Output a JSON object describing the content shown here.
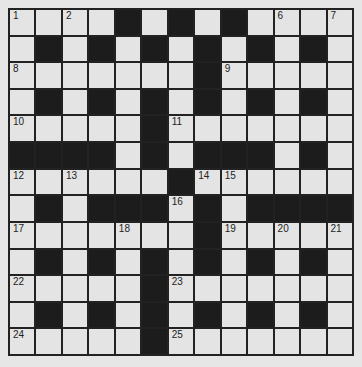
{
  "puzzle": {
    "rows": 13,
    "cols": 13,
    "colors": {
      "background": "#e6e6e6",
      "cell": "#e4e4e4",
      "block": "#1c1c1c",
      "line": "#222222"
    },
    "layout": [
      "....#.#.#....",
      ".#.#.#.#.#.#.",
      ".......#.....",
      ".#.#.#.#.#.#.",
      ".....#.......",
      "####.#.###.#.",
      "......#......",
      ".#.###.#.####",
      ".......#.....",
      ".#.#.#.#.#.#.",
      ".....#.......",
      ".#.#.#.#.#.#.",
      ".....#......."
    ],
    "numbers": [
      {
        "r": 0,
        "c": 0,
        "n": "1"
      },
      {
        "r": 0,
        "c": 2,
        "n": "2"
      },
      {
        "r": 0,
        "c": 4,
        "n": "3"
      },
      {
        "r": 0,
        "c": 6,
        "n": "4"
      },
      {
        "r": 0,
        "c": 8,
        "n": "5"
      },
      {
        "r": 0,
        "c": 10,
        "n": "6"
      },
      {
        "r": 0,
        "c": 12,
        "n": "7"
      },
      {
        "r": 2,
        "c": 0,
        "n": "8"
      },
      {
        "r": 2,
        "c": 8,
        "n": "9"
      },
      {
        "r": 4,
        "c": 0,
        "n": "10"
      },
      {
        "r": 4,
        "c": 6,
        "n": "11"
      },
      {
        "r": 6,
        "c": 0,
        "n": "12"
      },
      {
        "r": 6,
        "c": 2,
        "n": "13"
      },
      {
        "r": 6,
        "c": 7,
        "n": "14"
      },
      {
        "r": 6,
        "c": 8,
        "n": "15"
      },
      {
        "r": 7,
        "c": 6,
        "n": "16"
      },
      {
        "r": 8,
        "c": 0,
        "n": "17"
      },
      {
        "r": 8,
        "c": 4,
        "n": "18"
      },
      {
        "r": 8,
        "c": 8,
        "n": "19"
      },
      {
        "r": 8,
        "c": 10,
        "n": "20"
      },
      {
        "r": 8,
        "c": 12,
        "n": "21"
      },
      {
        "r": 10,
        "c": 0,
        "n": "22"
      },
      {
        "r": 10,
        "c": 6,
        "n": "23"
      },
      {
        "r": 12,
        "c": 0,
        "n": "24"
      },
      {
        "r": 12,
        "c": 6,
        "n": "25"
      }
    ]
  }
}
